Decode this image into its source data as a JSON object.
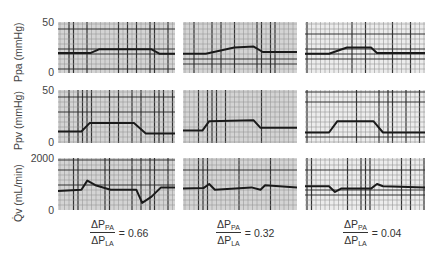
{
  "chart_data": {
    "type": "line",
    "title": "",
    "layout": "3x3 grid of strip-chart recordings",
    "columns": [
      {
        "label_num": "ΔP",
        "num_sub": "PA",
        "label_den": "ΔP",
        "den_sub": "LA",
        "value": "= 0.66"
      },
      {
        "label_num": "ΔP",
        "num_sub": "PA",
        "label_den": "ΔP",
        "den_sub": "LA",
        "value": "= 0.32"
      },
      {
        "label_num": "ΔP",
        "num_sub": "PA",
        "label_den": "ΔP",
        "den_sub": "LA",
        "value": "= 0.04"
      }
    ],
    "rows": [
      {
        "ylabel": "Ppa (mmHg)",
        "ymax_label": "50",
        "ymin_label": "0",
        "ylim": [
          0,
          50
        ]
      },
      {
        "ylabel": "Ppv (mmHg)",
        "ymax_label": "50",
        "ymin_label": "0",
        "ylim": [
          0,
          50
        ]
      },
      {
        "ylabel": "Q̇v (mL/min)",
        "ymax_label": "2000",
        "ymin_label": "0",
        "ylim": [
          0,
          2000
        ]
      }
    ],
    "series": [
      {
        "name": "Ppa, ratio 0.66",
        "x": [
          0,
          0.28,
          0.35,
          0.8,
          0.87,
          1
        ],
        "values": [
          19,
          19,
          23,
          23,
          18,
          18
        ]
      },
      {
        "name": "Ppa, ratio 0.32",
        "x": [
          0,
          0.2,
          0.45,
          0.62,
          0.7,
          1
        ],
        "values": [
          18,
          18,
          25,
          26,
          20,
          20
        ]
      },
      {
        "name": "Ppa, ratio 0.04",
        "x": [
          0,
          0.2,
          0.35,
          0.55,
          0.6,
          1
        ],
        "values": [
          18,
          18,
          25,
          25,
          19,
          19
        ]
      },
      {
        "name": "Ppv, ratio 0.66",
        "x": [
          0,
          0.2,
          0.27,
          0.65,
          0.75,
          1
        ],
        "values": [
          9,
          9,
          18,
          18,
          7,
          7
        ]
      },
      {
        "name": "Ppv, ratio 0.32",
        "x": [
          0,
          0.17,
          0.23,
          0.62,
          0.68,
          1
        ],
        "values": [
          10,
          10,
          20,
          21,
          13,
          13
        ]
      },
      {
        "name": "Ppv, ratio 0.04",
        "x": [
          0,
          0.2,
          0.27,
          0.57,
          0.65,
          1
        ],
        "values": [
          8,
          8,
          20,
          20,
          8,
          8
        ]
      },
      {
        "name": "Qv, ratio 0.66",
        "x": [
          0,
          0.2,
          0.25,
          0.32,
          0.45,
          0.67,
          0.72,
          0.8,
          0.88,
          1
        ],
        "values": [
          700,
          750,
          1150,
          950,
          750,
          750,
          180,
          450,
          850,
          850
        ]
      },
      {
        "name": "Qv, ratio 0.32",
        "x": [
          0,
          0.18,
          0.23,
          0.28,
          0.6,
          0.68,
          0.72,
          1
        ],
        "values": [
          800,
          820,
          1000,
          750,
          850,
          750,
          950,
          850
        ]
      },
      {
        "name": "Qv, ratio 0.04",
        "x": [
          0,
          0.2,
          0.25,
          0.3,
          0.55,
          0.6,
          0.65,
          1
        ],
        "values": [
          900,
          900,
          650,
          800,
          800,
          1000,
          900,
          850
        ]
      }
    ]
  }
}
